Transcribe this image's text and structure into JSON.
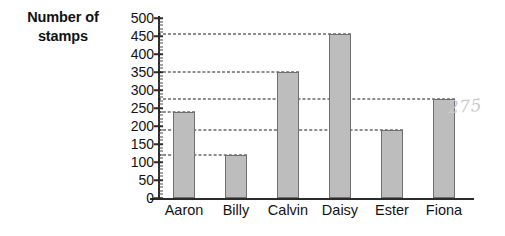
{
  "chart_data": {
    "type": "bar",
    "title": "",
    "subtitle": "",
    "xlabel": "",
    "ylabel": "Number of stamps",
    "categories": [
      "Aaron",
      "Billy",
      "Calvin",
      "Daisy",
      "Ester",
      "Fiona"
    ],
    "values": [
      240,
      120,
      350,
      455,
      190,
      275
    ],
    "ylim": [
      0,
      500
    ],
    "y_major_step": 50,
    "y_minor_step": 10,
    "y_ticks": [
      0,
      50,
      100,
      150,
      200,
      250,
      300,
      350,
      400,
      450,
      500
    ],
    "y_tick_labels": [
      "0",
      "50",
      "100",
      "150",
      "200",
      "250",
      "300",
      "350",
      "400",
      "450",
      "500"
    ],
    "grid": "horizontal-dashed-at-bar-tops",
    "gridline_values": [
      120,
      190,
      240,
      275,
      350,
      455
    ],
    "legend": "none",
    "bar_fill_color": "#bdbdbd",
    "bar_edge_color": "#6f6f6f",
    "axis_color": "#2b2b2b",
    "gridline_color": "#1d1d1d",
    "background_color": "#ffffff",
    "annotations": [
      {
        "text": "275",
        "kind": "handwritten",
        "color": "#c9c9c9",
        "position": "right-of-fiona-bar"
      }
    ]
  },
  "y_axis": {
    "title_line_1": "Number of",
    "title_line_2": "stamps"
  }
}
